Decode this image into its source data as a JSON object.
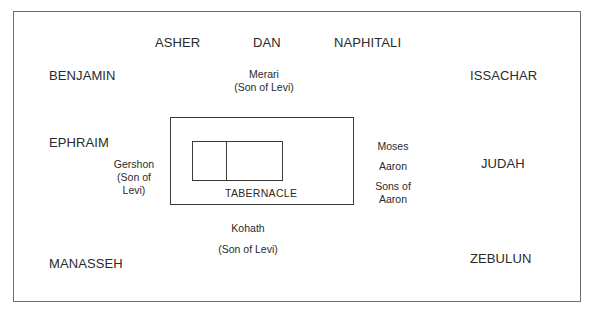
{
  "diagram": {
    "north": {
      "tribes": [
        "ASHER",
        "DAN",
        "NAPHITALI"
      ],
      "levite": {
        "name": "Merari",
        "note": "(Son of Levi)"
      }
    },
    "west": {
      "tribes": [
        "BENJAMIN",
        "EPHRAIM",
        "MANASSEH"
      ],
      "levite": {
        "name": "Gershon",
        "note_line1": "(Son of",
        "note_line2": "Levi)"
      }
    },
    "east": {
      "tribes": [
        "ISSACHAR",
        "JUDAH",
        "ZEBULUN"
      ],
      "priests": [
        "Moses",
        "Aaron",
        "Sons of",
        "Aaron"
      ]
    },
    "south": {
      "levite": {
        "name": "Kohath",
        "note": "(Son of Levi)"
      }
    },
    "center": {
      "label": "TABERNACLE"
    }
  }
}
